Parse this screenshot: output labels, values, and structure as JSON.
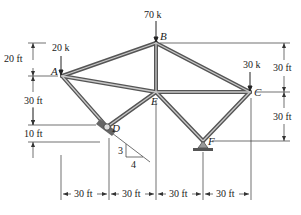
{
  "colors": {
    "member_outer": "#555555",
    "member_inner": "#bdbdbd",
    "line": "#333333",
    "text": "#222222"
  },
  "joints": {
    "A": {
      "label": "A",
      "x": 62,
      "y": 76
    },
    "B": {
      "label": "B",
      "x": 156,
      "y": 43
    },
    "C": {
      "label": "C",
      "x": 250,
      "y": 92
    },
    "D": {
      "label": "D",
      "x": 107,
      "y": 127
    },
    "E": {
      "label": "E",
      "x": 156,
      "y": 92
    },
    "F": {
      "label": "F",
      "x": 203,
      "y": 141
    }
  },
  "members": [
    [
      "A",
      "B"
    ],
    [
      "B",
      "C"
    ],
    [
      "A",
      "E"
    ],
    [
      "E",
      "C"
    ],
    [
      "B",
      "E"
    ],
    [
      "A",
      "D"
    ],
    [
      "D",
      "E"
    ],
    [
      "E",
      "F"
    ],
    [
      "F",
      "C"
    ]
  ],
  "loads": {
    "A": "20 k",
    "B": "70 k",
    "C": "30 k"
  },
  "dimensions": {
    "left": [
      "20 ft",
      "30 ft",
      "10 ft"
    ],
    "right": [
      "30 ft",
      "30 ft"
    ],
    "bottom": [
      "30 ft",
      "30 ft",
      "30 ft",
      "30 ft"
    ]
  },
  "slope": {
    "rise": "3",
    "run": "4"
  },
  "supports": {
    "D": "rocker on incline",
    "F": "pin"
  }
}
